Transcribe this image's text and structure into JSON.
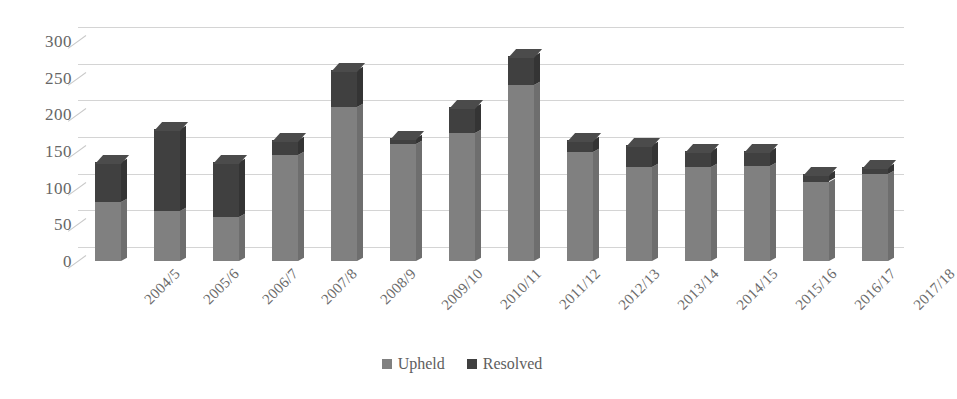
{
  "chart_data": {
    "type": "bar",
    "subtype": "stacked-column-3d",
    "title": "",
    "subtitle": "",
    "xlabel": "",
    "ylabel": "",
    "ylim": [
      0,
      300
    ],
    "ytick_values": [
      300,
      250,
      200,
      150,
      100,
      50,
      0
    ],
    "ytick_labels": [
      "300",
      "250",
      "200",
      "150",
      "100",
      "50",
      "0"
    ],
    "grid": true,
    "legend_position": "bottom-center",
    "categories": [
      "2004/5",
      "2005/6",
      "2006/7",
      "2007/8",
      "2008/9",
      "2009/10",
      "2010/11",
      "2011/12",
      "2012/13",
      "2013/14",
      "2014/15",
      "2015/16",
      "2016/17",
      "2017/18"
    ],
    "series": [
      {
        "name": "Upheld",
        "color": "#808080",
        "values": [
          80,
          68,
          60,
          145,
          210,
          160,
          175,
          240,
          148,
          128,
          128,
          130,
          108,
          118
        ]
      },
      {
        "name": "Resolved",
        "color": "#404040",
        "values": [
          55,
          112,
          75,
          20,
          50,
          8,
          35,
          40,
          17,
          30,
          22,
          20,
          10,
          10
        ]
      }
    ],
    "totals": [
      135,
      180,
      135,
      165,
      260,
      168,
      210,
      280,
      165,
      158,
      150,
      150,
      118,
      128
    ]
  },
  "legend": {
    "items": [
      {
        "label": "Upheld",
        "color": "#808080"
      },
      {
        "label": "Resolved",
        "color": "#404040"
      }
    ]
  }
}
